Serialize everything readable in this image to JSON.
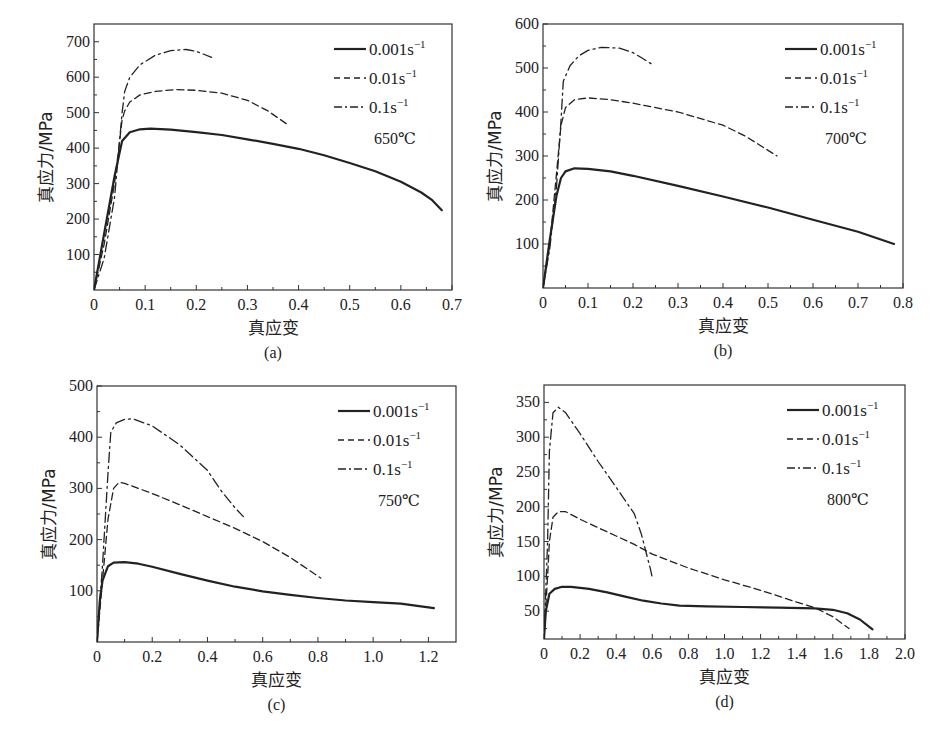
{
  "figure": {
    "panels": [
      "(a)",
      "(b)",
      "(c)",
      "(d)"
    ]
  },
  "chart_data": [
    {
      "type": "line",
      "panel": "(a)",
      "annotation": "650℃",
      "xlabel": "真应变",
      "ylabel": "真应力/MPa",
      "xlim": [
        0,
        0.7
      ],
      "ylim": [
        0,
        750
      ],
      "xticks": [
        0,
        0.1,
        0.2,
        0.3,
        0.4,
        0.5,
        0.6,
        0.7
      ],
      "xtick_labels": [
        "0",
        "0.1",
        "0.2",
        "0.3",
        "0.4",
        "0.5",
        "0.6",
        "0.7"
      ],
      "yticks": [
        100,
        200,
        300,
        400,
        500,
        600,
        700
      ],
      "ytick_labels": [
        "100",
        "200",
        "300",
        "400",
        "500",
        "600",
        "700"
      ],
      "grid": false,
      "legend_position": "upper right",
      "box": [
        94,
        24,
        452,
        290
      ],
      "series": [
        {
          "name": "0.001s⁻¹",
          "style": "solid",
          "x": [
            0.0,
            0.02,
            0.04,
            0.055,
            0.07,
            0.09,
            0.11,
            0.15,
            0.2,
            0.25,
            0.3,
            0.35,
            0.4,
            0.45,
            0.5,
            0.55,
            0.6,
            0.64,
            0.66,
            0.68
          ],
          "y": [
            0,
            160,
            320,
            420,
            445,
            453,
            455,
            452,
            445,
            437,
            425,
            412,
            398,
            380,
            358,
            335,
            305,
            275,
            255,
            225
          ]
        },
        {
          "name": "0.01s⁻¹",
          "style": "dashed",
          "x": [
            0.0,
            0.02,
            0.04,
            0.055,
            0.06,
            0.07,
            0.09,
            0.12,
            0.16,
            0.2,
            0.25,
            0.3,
            0.34,
            0.38
          ],
          "y": [
            0,
            130,
            300,
            480,
            505,
            530,
            550,
            560,
            565,
            563,
            555,
            535,
            505,
            465
          ]
        },
        {
          "name": "0.1s⁻¹",
          "style": "dashdot",
          "x": [
            0.0,
            0.02,
            0.04,
            0.055,
            0.06,
            0.07,
            0.09,
            0.12,
            0.15,
            0.18,
            0.2,
            0.23
          ],
          "y": [
            0,
            90,
            260,
            500,
            560,
            600,
            635,
            662,
            675,
            678,
            673,
            656
          ]
        }
      ]
    },
    {
      "type": "line",
      "panel": "(b)",
      "annotation": "700℃",
      "xlabel": "真应变",
      "ylabel": "真应力/MPa",
      "xlim": [
        0,
        0.8
      ],
      "ylim": [
        0,
        600
      ],
      "xticks": [
        0,
        0.1,
        0.2,
        0.3,
        0.4,
        0.5,
        0.6,
        0.7,
        0.8
      ],
      "xtick_labels": [
        "0",
        "0.1",
        "0.2",
        "0.3",
        "0.4",
        "0.5",
        "0.6",
        "0.7",
        "0.8"
      ],
      "yticks": [
        100,
        200,
        300,
        400,
        500,
        600
      ],
      "ytick_labels": [
        "100",
        "200",
        "300",
        "400",
        "500",
        "600"
      ],
      "grid": false,
      "legend_position": "upper right",
      "box": [
        543,
        24,
        903,
        288
      ],
      "series": [
        {
          "name": "0.001s⁻¹",
          "style": "solid",
          "x": [
            0.0,
            0.015,
            0.03,
            0.04,
            0.05,
            0.07,
            0.1,
            0.15,
            0.2,
            0.3,
            0.4,
            0.5,
            0.6,
            0.7,
            0.78
          ],
          "y": [
            0,
            110,
            210,
            250,
            265,
            272,
            271,
            265,
            255,
            232,
            208,
            183,
            155,
            128,
            100
          ]
        },
        {
          "name": "0.01s⁻¹",
          "style": "dashed",
          "x": [
            0.0,
            0.015,
            0.03,
            0.04,
            0.05,
            0.07,
            0.1,
            0.15,
            0.2,
            0.3,
            0.4,
            0.45,
            0.52
          ],
          "y": [
            0,
            100,
            260,
            370,
            410,
            428,
            432,
            428,
            420,
            400,
            370,
            345,
            300
          ]
        },
        {
          "name": "0.1s⁻¹",
          "style": "dashdot",
          "x": [
            0.0,
            0.015,
            0.03,
            0.04,
            0.045,
            0.06,
            0.08,
            0.1,
            0.13,
            0.17,
            0.2,
            0.24
          ],
          "y": [
            0,
            90,
            230,
            380,
            470,
            505,
            528,
            540,
            547,
            545,
            535,
            510
          ]
        }
      ]
    },
    {
      "type": "line",
      "panel": "(c)",
      "annotation": "750℃",
      "xlabel": "真应变",
      "ylabel": "真应力/MPa",
      "xlim": [
        0,
        1.3
      ],
      "ylim": [
        0,
        500
      ],
      "xticks": [
        0,
        0.2,
        0.4,
        0.6,
        0.8,
        1.0,
        1.2
      ],
      "xtick_labels": [
        "0",
        "0.2",
        "0.4",
        "0.6",
        "0.8",
        "1.0",
        "1.2"
      ],
      "yticks": [
        100,
        200,
        300,
        400,
        500
      ],
      "ytick_labels": [
        "100",
        "200",
        "300",
        "400",
        "500"
      ],
      "grid": false,
      "legend_position": "upper right",
      "box": [
        97,
        386,
        456,
        642
      ],
      "series": [
        {
          "name": "0.001s⁻¹",
          "style": "solid",
          "x": [
            0.0,
            0.01,
            0.02,
            0.04,
            0.06,
            0.1,
            0.15,
            0.2,
            0.3,
            0.4,
            0.5,
            0.6,
            0.7,
            0.8,
            0.9,
            1.0,
            1.1,
            1.22
          ],
          "y": [
            0,
            80,
            120,
            148,
            155,
            156,
            153,
            147,
            133,
            120,
            108,
            99,
            92,
            86,
            81,
            78,
            75,
            66
          ]
        },
        {
          "name": "0.01s⁻¹",
          "style": "dashed",
          "x": [
            0.0,
            0.02,
            0.04,
            0.06,
            0.08,
            0.1,
            0.2,
            0.3,
            0.4,
            0.5,
            0.6,
            0.7,
            0.81
          ],
          "y": [
            0,
            120,
            240,
            300,
            312,
            310,
            290,
            268,
            245,
            222,
            196,
            165,
            125
          ]
        },
        {
          "name": "0.1s⁻¹",
          "style": "dashdot",
          "x": [
            0.0,
            0.02,
            0.04,
            0.05,
            0.07,
            0.1,
            0.13,
            0.2,
            0.3,
            0.4,
            0.45,
            0.5,
            0.53
          ],
          "y": [
            0,
            150,
            330,
            410,
            428,
            435,
            436,
            422,
            385,
            335,
            295,
            262,
            245
          ]
        }
      ]
    },
    {
      "type": "line",
      "panel": "(d)",
      "annotation": "800℃",
      "xlabel": "真应变",
      "ylabel": "真应力/MPa",
      "xlim": [
        0,
        2.0
      ],
      "ylim": [
        10,
        375
      ],
      "xticks": [
        0,
        0.2,
        0.4,
        0.6,
        0.8,
        1.0,
        1.2,
        1.4,
        1.6,
        1.8,
        2.0
      ],
      "xtick_labels": [
        "0",
        "0.2",
        "0.4",
        "0.6",
        "0.8",
        "1.0",
        "1.2",
        "1.4",
        "1.6",
        "1.8",
        "2.0"
      ],
      "yticks": [
        50,
        100,
        150,
        200,
        250,
        300,
        350
      ],
      "ytick_labels": [
        "50",
        "100",
        "150",
        "200",
        "250",
        "300",
        "350"
      ],
      "grid": false,
      "legend_position": "upper right",
      "box": [
        544,
        385,
        905,
        639
      ],
      "series": [
        {
          "name": "0.001s⁻¹",
          "style": "solid",
          "x": [
            0.0,
            0.01,
            0.03,
            0.06,
            0.1,
            0.15,
            0.25,
            0.35,
            0.45,
            0.55,
            0.65,
            0.75,
            0.9,
            1.1,
            1.3,
            1.5,
            1.6,
            1.68,
            1.75,
            1.82
          ],
          "y": [
            10,
            50,
            75,
            82,
            85,
            85,
            82,
            77,
            71,
            65,
            61,
            58,
            57,
            56,
            55,
            54,
            52,
            47,
            38,
            24
          ]
        },
        {
          "name": "0.01s⁻¹",
          "style": "dashed",
          "x": [
            0.0,
            0.02,
            0.03,
            0.05,
            0.08,
            0.12,
            0.2,
            0.3,
            0.4,
            0.5,
            0.6,
            0.8,
            1.0,
            1.2,
            1.4,
            1.5,
            1.6,
            1.69
          ],
          "y": [
            10,
            100,
            150,
            185,
            193,
            193,
            182,
            170,
            158,
            146,
            132,
            112,
            95,
            80,
            63,
            55,
            42,
            25
          ]
        },
        {
          "name": "0.1s⁻¹",
          "style": "dashdot",
          "x": [
            0.0,
            0.02,
            0.03,
            0.05,
            0.08,
            0.12,
            0.2,
            0.3,
            0.4,
            0.5,
            0.54,
            0.57,
            0.59,
            0.6
          ],
          "y": [
            10,
            150,
            280,
            335,
            343,
            335,
            305,
            265,
            228,
            190,
            160,
            130,
            110,
            98
          ]
        }
      ]
    }
  ]
}
